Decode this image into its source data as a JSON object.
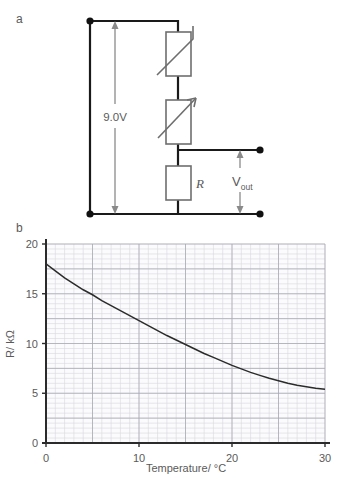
{
  "figure": {
    "panels": [
      {
        "key": "a",
        "label": "a",
        "caption": "circuit-diagram"
      },
      {
        "key": "b",
        "label": "b",
        "caption": "resistance-temperature-graph"
      }
    ]
  },
  "circuit": {
    "supply_label": "9.0V",
    "output_label_main": "V",
    "output_label_sub": "out",
    "resistor_label": "R",
    "components": [
      {
        "name": "thermistor",
        "symbol": "variable-resistor-hooked-diagonal"
      },
      {
        "name": "variable-resistor",
        "symbol": "variable-resistor-arrow-diagonal"
      },
      {
        "name": "fixed-resistor",
        "symbol": "rectangle",
        "label": "R"
      }
    ],
    "terminals": 4,
    "colors": {
      "wire": "#1a1a1a",
      "component_outline": "#6e6e6e",
      "dimension_arrow": "#8a8a8a",
      "terminal_dot": "#111111"
    }
  },
  "chart_data": {
    "type": "line",
    "title": "",
    "xlabel": "Temperature/ °C",
    "ylabel": "R/ kΩ",
    "xlim": [
      0,
      30
    ],
    "ylim": [
      0,
      20
    ],
    "xticks": [
      0,
      10,
      20,
      30
    ],
    "xtick_labels": [
      "0",
      "10",
      "20",
      "30"
    ],
    "yticks": [
      0,
      5,
      10,
      15,
      20
    ],
    "ytick_labels": [
      "0",
      "5",
      "10",
      "15",
      "20"
    ],
    "grid": true,
    "grid_minor_step_x": 1,
    "grid_minor_step_y": 0.5,
    "grid_major_step_x": 5,
    "grid_major_step_y": 2.5,
    "legend": null,
    "series": [
      {
        "name": "thermistor resistance",
        "x": [
          0,
          1,
          2,
          3,
          4,
          5,
          6,
          7,
          8,
          9,
          10,
          11,
          12,
          13,
          14,
          15,
          16,
          17,
          18,
          19,
          20,
          21,
          22,
          23,
          24,
          25,
          26,
          27,
          28,
          29,
          30
        ],
        "values": [
          18.0,
          17.3,
          16.6,
          16.0,
          15.4,
          14.9,
          14.3,
          13.8,
          13.3,
          12.8,
          12.3,
          11.8,
          11.3,
          10.8,
          10.35,
          9.9,
          9.45,
          9.0,
          8.6,
          8.2,
          7.8,
          7.45,
          7.1,
          6.8,
          6.5,
          6.25,
          6.0,
          5.8,
          5.65,
          5.5,
          5.4
        ],
        "color": "#2b2b2b"
      }
    ],
    "colors": {
      "axis": "#2b2b2b",
      "grid_minor": "#d7d7dd",
      "grid_major": "#a9a9b4",
      "plot_background": "#fbfbfd",
      "tick_text": "#4a4a4a"
    }
  }
}
